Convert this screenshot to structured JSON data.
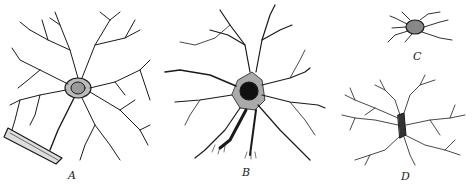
{
  "figure": {
    "panels": [
      {
        "id": "A",
        "label": "A",
        "subject": "cell with dense branching processes and vascular end-foot"
      },
      {
        "id": "B",
        "label": "B",
        "subject": "cell with long radiating processes and dark nucleus"
      },
      {
        "id": "C",
        "label": "C",
        "subject": "small cell with few short processes"
      },
      {
        "id": "D",
        "label": "D",
        "subject": "elongated cell with fine bushy processes"
      }
    ],
    "colors": {
      "ink": "#1a1a1a",
      "background": "#ffffff"
    }
  }
}
